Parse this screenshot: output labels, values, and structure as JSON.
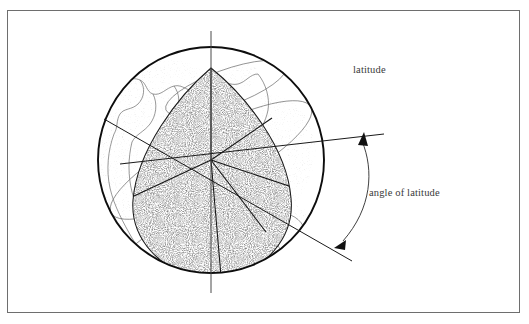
{
  "figure": {
    "frame": {
      "x": 7,
      "y": 10,
      "width": 513,
      "height": 303,
      "stroke": "#6e6e6e",
      "fill": "#ffffff"
    },
    "labels": {
      "latitude": "latitude",
      "angle_of_latitude": "angle of latitude"
    },
    "colors": {
      "ink": "#1a1a1a",
      "text": "#3a3a3a",
      "thin_line": "#555555",
      "coastline": "#6b6b6b",
      "stipple": "#2b2b2b",
      "background": "#ffffff"
    },
    "globe": {
      "center_x": 211,
      "center_y": 160,
      "radius": 114,
      "axis_top_y": 31,
      "axis_bottom_y": 293,
      "pole_label": "polar axis"
    },
    "sector": {
      "apex_x": 211,
      "apex_y": 68,
      "description": "stippled teardrop lune",
      "radial_lines": 5
    },
    "latitude_line": {
      "start_x": 120,
      "start_y": 163,
      "end_x": 384,
      "end_y": 134,
      "arrow_x": 363,
      "arrow_y": 137
    },
    "equator_line": {
      "start_x": 104,
      "start_y": 120,
      "end_x": 352,
      "end_y": 261,
      "arrow_x": 339,
      "arrow_y": 246
    },
    "angle_arc": {
      "from_x": 363,
      "from_y": 139,
      "to_x": 340,
      "to_y": 244,
      "sweep": "angle between equator plane and latitude line"
    }
  }
}
